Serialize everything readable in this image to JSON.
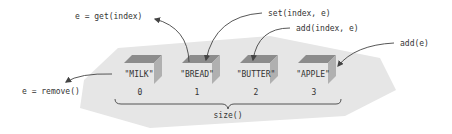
{
  "diagram": {
    "elements": [
      {
        "value": "\"MILK\"",
        "index": "0"
      },
      {
        "value": "\"BREAD\"",
        "index": "1"
      },
      {
        "value": "\"BUTTER\"",
        "index": "2"
      },
      {
        "value": "\"APPLE\"",
        "index": "3"
      }
    ],
    "operations": {
      "get": "e = get(index)",
      "set": "set(index, e)",
      "add_index": "add(index, e)",
      "add": "add(e)",
      "remove": "e = remove()"
    },
    "size_label": "size()",
    "colors": {
      "background_shape": "#e6e6e6",
      "box_top": "#8c8c8c",
      "box_side": "#b0b0b0",
      "arrow": "#444444",
      "text": "#333333"
    }
  }
}
